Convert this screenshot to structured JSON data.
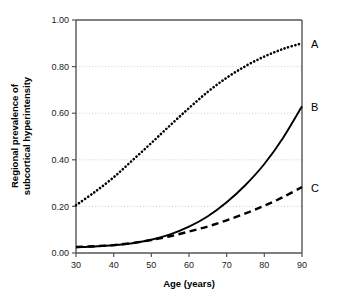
{
  "chart_data": {
    "type": "line",
    "title": "",
    "xlabel": "Age (years)",
    "ylabel": "Regional prevalence of subcortical hyperintensity",
    "ylabel_line1": "Regional prevalence of",
    "ylabel_line2": "subcortical hyperintensity",
    "xlim": [
      30,
      90
    ],
    "ylim": [
      0.0,
      1.0
    ],
    "xticks": [
      30,
      40,
      50,
      60,
      70,
      80,
      90
    ],
    "xtick_labels": [
      "30",
      "40",
      "50",
      "60",
      "70",
      "80",
      "90"
    ],
    "yticks": [
      0.0,
      0.2,
      0.4,
      0.6,
      0.8,
      1.0
    ],
    "ytick_labels": [
      "0.00",
      "0.20",
      "0.40",
      "0.60",
      "0.80",
      "1.00"
    ],
    "grid": "horizontal-dotted",
    "gridlines_at": [
      0.2,
      0.4,
      0.6,
      0.8
    ],
    "legend_position": "right-inline-annotations",
    "x": [
      30,
      35,
      40,
      45,
      50,
      55,
      60,
      65,
      70,
      75,
      80,
      85,
      90
    ],
    "series": [
      {
        "name": "A",
        "label": "A",
        "style": "dotted",
        "color": "#000000",
        "values": [
          0.205,
          0.262,
          0.325,
          0.398,
          0.472,
          0.548,
          0.622,
          0.692,
          0.752,
          0.802,
          0.843,
          0.876,
          0.9
        ]
      },
      {
        "name": "B",
        "label": "B",
        "style": "solid",
        "color": "#000000",
        "values": [
          0.025,
          0.028,
          0.033,
          0.042,
          0.057,
          0.08,
          0.113,
          0.158,
          0.218,
          0.292,
          0.382,
          0.495,
          0.63
        ]
      },
      {
        "name": "C",
        "label": "C",
        "style": "dashed",
        "color": "#000000",
        "values": [
          0.026,
          0.029,
          0.034,
          0.043,
          0.056,
          0.072,
          0.092,
          0.114,
          0.14,
          0.17,
          0.203,
          0.24,
          0.283
        ]
      }
    ],
    "annotations": [
      {
        "text": "A",
        "x": 90,
        "y": 0.9
      },
      {
        "text": "B",
        "x": 90,
        "y": 0.63
      },
      {
        "text": "C",
        "x": 90,
        "y": 0.283
      }
    ],
    "colors": {
      "axis": "#555555",
      "grid": "#bfbfbf",
      "curve": "#000000",
      "background": "#ffffff"
    }
  }
}
